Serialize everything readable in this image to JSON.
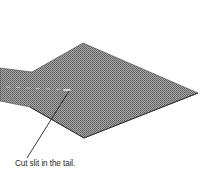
{
  "figure": {
    "fill_color": "#8c8c8c",
    "edge_color": "#3a3a3a",
    "leader_color": "#222222",
    "slit_color": "#d8d8d8"
  },
  "annotation": {
    "label": "Cut slit in the tail."
  }
}
